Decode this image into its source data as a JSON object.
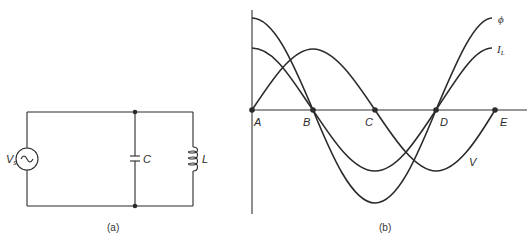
{
  "circuit": {
    "caption": "(a)",
    "source_label": "V",
    "source_subscript": "s",
    "source_symbol": "~",
    "capacitor_label": "C",
    "inductor_label": "L"
  },
  "graph": {
    "caption": "(b)",
    "points": [
      {
        "label": "A"
      },
      {
        "label": "B"
      },
      {
        "label": "C"
      },
      {
        "label": "D"
      },
      {
        "label": "E"
      }
    ],
    "curves": {
      "flux": {
        "label": "ϕ"
      },
      "current": {
        "label": "I",
        "subscript": "L"
      },
      "voltage": {
        "label": "V"
      }
    }
  },
  "colors": {
    "ink": "#2b2b2b",
    "background": "#ffffff"
  }
}
